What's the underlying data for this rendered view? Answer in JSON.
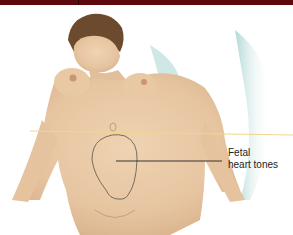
{
  "diagram": {
    "callouts": [
      {
        "line1": "Fetal",
        "line2": "heart tones"
      }
    ],
    "reference_line_color": "#f1d68a",
    "fetal_outline_color": "#6b6157",
    "header_bar_color": "#5e0a0d",
    "skin_color": "#e8c9a6"
  }
}
